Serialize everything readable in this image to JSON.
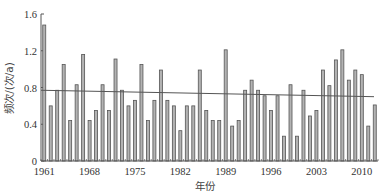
{
  "chart_data": {
    "type": "bar",
    "title": "",
    "xlabel": "年份",
    "ylabel": "频次/(次/a)",
    "ylim": [
      0,
      1.6
    ],
    "yticks": [
      "0",
      "0.4",
      "0.8",
      "1.2",
      "1.6"
    ],
    "xticks": [
      "1961",
      "1968",
      "1975",
      "1982",
      "1989",
      "1996",
      "2003",
      "2010"
    ],
    "grid": false,
    "legend": null,
    "categories": [
      1961,
      1962,
      1963,
      1964,
      1965,
      1966,
      1967,
      1968,
      1969,
      1970,
      1971,
      1972,
      1973,
      1974,
      1975,
      1976,
      1977,
      1978,
      1979,
      1980,
      1981,
      1982,
      1983,
      1984,
      1985,
      1986,
      1987,
      1988,
      1989,
      1990,
      1991,
      1992,
      1993,
      1994,
      1995,
      1996,
      1997,
      1998,
      1999,
      2000,
      2001,
      2002,
      2003,
      2004,
      2005,
      2006,
      2007,
      2008,
      2009,
      2010,
      2011,
      2012
    ],
    "values": [
      1.48,
      0.6,
      0.77,
      1.05,
      0.44,
      0.83,
      1.16,
      0.44,
      0.55,
      0.83,
      0.55,
      1.11,
      0.77,
      0.6,
      0.66,
      1.05,
      0.44,
      0.66,
      0.99,
      0.66,
      0.6,
      0.33,
      0.6,
      0.6,
      0.99,
      0.55,
      0.44,
      0.44,
      1.21,
      0.38,
      0.44,
      0.77,
      0.88,
      0.77,
      0.71,
      0.55,
      0.71,
      0.27,
      0.83,
      0.27,
      0.77,
      0.49,
      0.55,
      0.99,
      0.82,
      1.1,
      1.21,
      0.88,
      0.99,
      0.94,
      0.38,
      0.61
    ],
    "trendline": {
      "start": 0.77,
      "end": 0.7
    },
    "bar_color": "#b3b3b3",
    "bar_edge_color": "#555555"
  }
}
